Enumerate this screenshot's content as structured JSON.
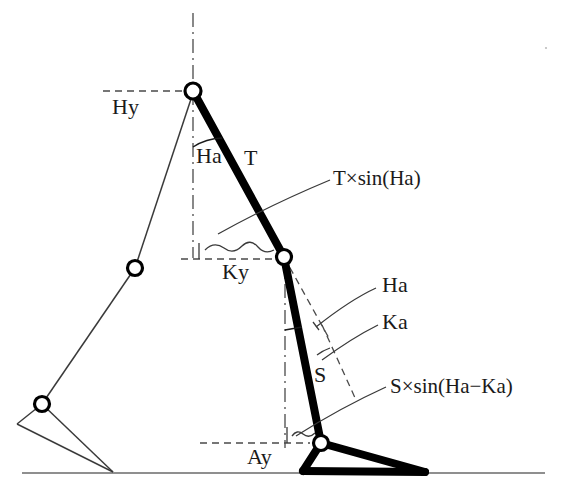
{
  "diagram": {
    "type": "technical-line-diagram",
    "canvas": {
      "width": 563,
      "height": 488
    },
    "colors": {
      "ink": "#1a1a1a",
      "thick_link": "#000000",
      "thin_link": "#3a3a3a",
      "dashed": "#4a4a4a",
      "ground": "#6a6a6a",
      "background": "#ffffff"
    },
    "labels": {
      "hip_height": "Hy",
      "hip_angle": "Ha",
      "thigh": "T",
      "knee_height": "Ky",
      "knee_angle": "Ka",
      "hip_angle_ref": "Ha",
      "shank": "S",
      "ankle_height": "Ay",
      "thigh_projection": "T×sin(Ha)",
      "shank_projection": "S×sin(Ha−Ka)"
    },
    "joints": [
      {
        "name": "hip",
        "x": 193,
        "y": 91,
        "style": "open-circle",
        "limb": "front"
      },
      {
        "name": "knee",
        "x": 284,
        "y": 257,
        "style": "open-circle",
        "limb": "front"
      },
      {
        "name": "ankle",
        "x": 321,
        "y": 443,
        "style": "open-circle",
        "limb": "front"
      },
      {
        "name": "rear-knee",
        "x": 135,
        "y": 268,
        "style": "open-circle",
        "limb": "rear"
      },
      {
        "name": "rear-ankle",
        "x": 42,
        "y": 404,
        "style": "open-circle",
        "limb": "rear"
      }
    ],
    "segments": [
      {
        "name": "thigh",
        "from": "hip",
        "to": "knee",
        "weight": "thick"
      },
      {
        "name": "shank",
        "from": "knee",
        "to": "ankle",
        "weight": "thick"
      },
      {
        "name": "foot-heel",
        "from": "ankle",
        "to": "heel",
        "weight": "thick"
      },
      {
        "name": "foot-toe",
        "from": "ankle",
        "to": "toe",
        "weight": "thick"
      },
      {
        "name": "foot-sole",
        "from": "heel",
        "to": "toe",
        "weight": "thick"
      },
      {
        "name": "rear-thigh",
        "from": "hip",
        "to": "rear-knee",
        "weight": "thin"
      },
      {
        "name": "rear-shank",
        "from": "rear-knee",
        "to": "rear-ankle",
        "weight": "thin"
      },
      {
        "name": "rear-foot",
        "from": "rear-ankle",
        "to": "rear-toe",
        "weight": "thin"
      }
    ],
    "reference_lines": [
      {
        "name": "hip-vertical",
        "style": "dash-dot",
        "orientation": "vertical"
      },
      {
        "name": "knee-vertical",
        "style": "dash-dot",
        "orientation": "vertical"
      },
      {
        "name": "hip-height-line",
        "style": "dashed",
        "orientation": "horizontal"
      },
      {
        "name": "knee-height-line",
        "style": "dashed",
        "orientation": "horizontal"
      },
      {
        "name": "ankle-height-line",
        "style": "dashed",
        "orientation": "horizontal"
      },
      {
        "name": "thigh-extension",
        "style": "dashed",
        "orientation": "oblique"
      },
      {
        "name": "shank-extension",
        "style": "dashed",
        "orientation": "oblique"
      },
      {
        "name": "ground-line",
        "style": "solid",
        "orientation": "horizontal"
      }
    ]
  }
}
